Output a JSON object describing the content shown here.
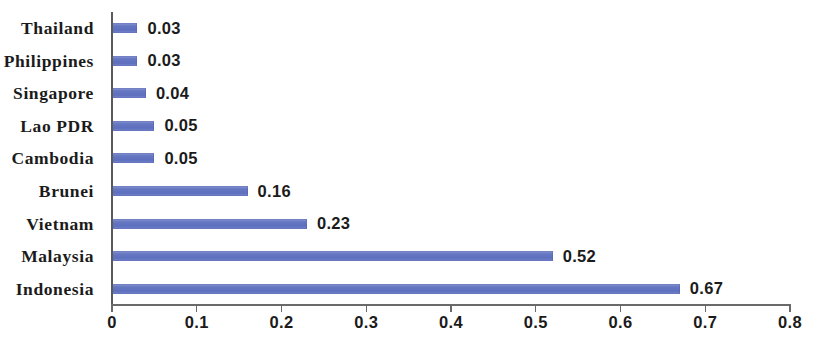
{
  "chart_data": {
    "type": "bar",
    "orientation": "horizontal",
    "title": "",
    "subtitle": "",
    "xlabel": "",
    "ylabel": "",
    "categories": [
      "Thailand",
      "Philippines",
      "Singapore",
      "Lao PDR",
      "Cambodia",
      "Brunei",
      "Vietnam",
      "Malaysia",
      "Indonesia"
    ],
    "values": [
      0.03,
      0.03,
      0.04,
      0.05,
      0.05,
      0.16,
      0.23,
      0.52,
      0.67
    ],
    "value_labels": [
      "0.03",
      "0.03",
      "0.04",
      "0.05",
      "0.05",
      "0.16",
      "0.23",
      "0.52",
      "0.67"
    ],
    "xlim": [
      0,
      0.8
    ],
    "xticks": [
      0,
      0.1,
      0.2,
      0.3,
      0.4,
      0.5,
      0.6,
      0.7,
      0.8
    ],
    "xtick_labels": [
      "0",
      "0.1",
      "0.2",
      "0.3",
      "0.4",
      "0.5",
      "0.6",
      "0.7",
      "0.8"
    ],
    "grid": false,
    "legend": false,
    "legend_position": "none",
    "bar_color": "#6677c2",
    "axis_color": "#5a5a5a",
    "background_color": "#ffffff",
    "data_labels_shown": true
  }
}
